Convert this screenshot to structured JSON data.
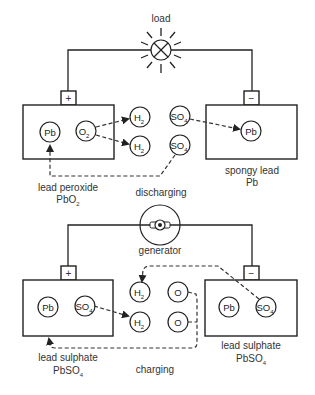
{
  "diagram": {
    "discharging": {
      "load_label": "load",
      "process_label": "discharging",
      "positive_terminal": "+",
      "negative_terminal": "−",
      "left_cell": {
        "particles": [
          {
            "label": "Pb",
            "sub": ""
          },
          {
            "label": "O",
            "sub": "2"
          }
        ],
        "caption_line1": "lead peroxide",
        "caption_line2": "PbO",
        "caption_sub": "2"
      },
      "electrolyte": {
        "h2": [
          {
            "label": "H",
            "sub": "2"
          },
          {
            "label": "H",
            "sub": "2"
          }
        ],
        "so4": [
          {
            "label": "SO",
            "sub": "4"
          },
          {
            "label": "SO",
            "sub": "4"
          }
        ]
      },
      "right_cell": {
        "particles": [
          {
            "label": "Pb",
            "sub": ""
          }
        ],
        "caption_line1": "spongy lead",
        "caption_line2": "Pb"
      }
    },
    "charging": {
      "generator_label": "generator",
      "process_label": "charging",
      "positive_terminal": "+",
      "negative_terminal": "−",
      "left_cell": {
        "particles": [
          {
            "label": "Pb",
            "sub": ""
          },
          {
            "label": "SO",
            "sub": "4"
          }
        ],
        "caption_line1": "lead sulphate",
        "caption_line2": "PbSO",
        "caption_sub": "4"
      },
      "electrolyte": {
        "h2": [
          {
            "label": "H",
            "sub": "2"
          },
          {
            "label": "H",
            "sub": "2"
          }
        ],
        "o": [
          {
            "label": "O"
          },
          {
            "label": "O"
          }
        ]
      },
      "right_cell": {
        "particles": [
          {
            "label": "Pb",
            "sub": ""
          },
          {
            "label": "SO",
            "sub": "4"
          }
        ],
        "caption_line1": "lead sulphate",
        "caption_line2": "PbSO",
        "caption_sub": "4"
      }
    },
    "colors": {
      "line": "#222222",
      "text": "#333333",
      "background": "#ffffff"
    }
  }
}
